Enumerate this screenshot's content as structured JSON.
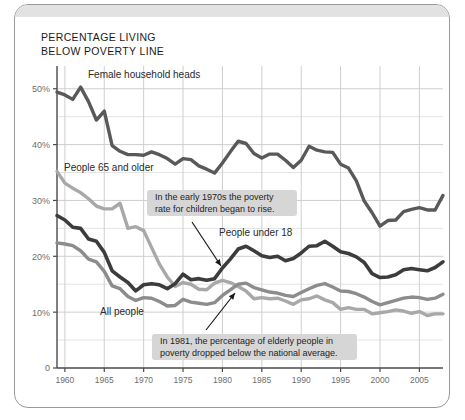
{
  "frame": {
    "top_strip_color": "#e2e2e2",
    "border_color": "#9a9a9a",
    "background": "#ffffff"
  },
  "title": "PERCENTAGE LIVING\nBELOW POVERTY LINE",
  "chart_data": {
    "type": "line",
    "title": "PERCENTAGE LIVING BELOW POVERTY LINE",
    "xlabel": "",
    "ylabel": "",
    "xlim": [
      1959,
      2008
    ],
    "ylim": [
      0,
      53
    ],
    "grid": true,
    "legend_position": "inline-labels",
    "y_ticks": [
      {
        "value": 50,
        "label": "50%"
      },
      {
        "value": 40,
        "label": "40%"
      },
      {
        "value": 30,
        "label": "30%"
      },
      {
        "value": 20,
        "label": "20%"
      },
      {
        "value": 10,
        "label": "10%"
      },
      {
        "value": 0,
        "label": "0"
      }
    ],
    "y_minor_gridlines": [
      45,
      35,
      25,
      15,
      5
    ],
    "x_ticks": [
      1960,
      1965,
      1970,
      1975,
      1980,
      1985,
      1990,
      1995,
      2000,
      2005
    ],
    "x": [
      1959,
      1960,
      1961,
      1962,
      1963,
      1964,
      1965,
      1966,
      1967,
      1968,
      1969,
      1970,
      1971,
      1972,
      1973,
      1974,
      1975,
      1976,
      1977,
      1978,
      1979,
      1980,
      1981,
      1982,
      1983,
      1984,
      1985,
      1986,
      1987,
      1988,
      1989,
      1990,
      1991,
      1992,
      1993,
      1994,
      1995,
      1996,
      1997,
      1998,
      1999,
      2000,
      2001,
      2002,
      2003,
      2004,
      2005,
      2006,
      2007,
      2008
    ],
    "series": [
      {
        "name": "Female household heads",
        "color": "#595959",
        "width": 3.4,
        "label_text": "Female household heads",
        "values": [
          49.4,
          48.9,
          48.1,
          50.3,
          47.7,
          44.4,
          46.0,
          39.8,
          38.8,
          38.2,
          38.2,
          38.1,
          38.7,
          38.2,
          37.5,
          36.5,
          37.5,
          37.3,
          36.2,
          35.6,
          34.9,
          36.7,
          38.7,
          40.6,
          40.2,
          38.4,
          37.6,
          38.3,
          38.3,
          37.2,
          35.9,
          37.2,
          39.7,
          39.0,
          38.7,
          38.6,
          36.5,
          35.8,
          33.5,
          29.9,
          27.8,
          25.4,
          26.4,
          26.5,
          28.0,
          28.4,
          28.7,
          28.3,
          28.3,
          30.9
        ]
      },
      {
        "name": "People 65 and older",
        "color": "#a8a8a8",
        "width": 3.4,
        "label_text": "People 65 and older",
        "values": [
          35.2,
          33.1,
          32.2,
          31.4,
          30.3,
          29.0,
          28.5,
          28.5,
          29.5,
          25.0,
          25.3,
          24.6,
          21.6,
          18.6,
          16.3,
          14.6,
          15.3,
          15.0,
          14.1,
          14.0,
          15.2,
          15.7,
          15.3,
          14.6,
          13.8,
          12.4,
          12.6,
          12.4,
          12.5,
          12.0,
          11.4,
          12.2,
          12.4,
          12.9,
          12.2,
          11.7,
          10.5,
          10.8,
          10.5,
          10.5,
          9.7,
          9.9,
          10.1,
          10.4,
          10.2,
          9.8,
          10.1,
          9.4,
          9.7,
          9.7
        ]
      },
      {
        "name": "People under 18",
        "color": "#3c3c3c",
        "width": 3.6,
        "label_text": "People under 18",
        "values": [
          27.3,
          26.5,
          25.2,
          25.0,
          23.1,
          22.7,
          20.7,
          17.4,
          16.3,
          15.3,
          13.8,
          14.9,
          15.1,
          14.9,
          14.2,
          15.1,
          16.8,
          15.8,
          16.0,
          15.7,
          16.0,
          17.9,
          19.5,
          21.3,
          21.8,
          21.0,
          20.1,
          19.8,
          20.0,
          19.2,
          19.6,
          20.6,
          21.8,
          21.9,
          22.7,
          21.8,
          20.8,
          20.5,
          19.9,
          18.9,
          16.9,
          16.2,
          16.3,
          16.7,
          17.6,
          17.8,
          17.6,
          17.4,
          18.0,
          19.0
        ]
      },
      {
        "name": "All people",
        "color": "#8c8c8c",
        "width": 3.4,
        "label_text": "All people",
        "values": [
          22.4,
          22.2,
          21.9,
          21.0,
          19.5,
          19.0,
          17.3,
          14.7,
          14.2,
          12.8,
          12.1,
          12.6,
          12.5,
          11.9,
          11.1,
          11.2,
          12.3,
          11.8,
          11.6,
          11.4,
          11.7,
          13.0,
          14.0,
          15.0,
          15.2,
          14.4,
          14.0,
          13.6,
          13.4,
          13.0,
          12.8,
          13.5,
          14.2,
          14.8,
          15.1,
          14.5,
          13.8,
          13.7,
          13.3,
          12.7,
          11.9,
          11.3,
          11.7,
          12.1,
          12.5,
          12.7,
          12.6,
          12.3,
          12.5,
          13.2
        ]
      }
    ],
    "annotations": [
      {
        "id": "children-rise",
        "text": "In the early 1970s the poverty\nrate for children began to rise.",
        "box_fill": "#d6d6d6",
        "arrow_from": {
          "x": 192,
          "y": 222
        },
        "arrow_to": {
          "x": 221,
          "y": 266
        }
      },
      {
        "id": "elderly-drop",
        "text": "In 1981, the percentage of elderly people in\npoverty dropped below the national average.",
        "box_fill": "#d6d6d6",
        "arrow_from": {
          "x": 206,
          "y": 330
        },
        "arrow_to": {
          "x": 235,
          "y": 293
        }
      }
    ]
  }
}
